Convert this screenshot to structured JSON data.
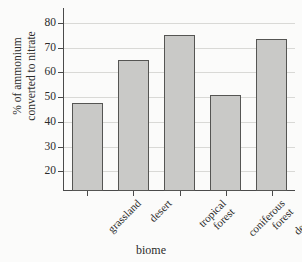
{
  "chart_data": {
    "type": "bar",
    "title": "",
    "xlabel": "biome",
    "ylabel": "% of ammonium converted to nitrate",
    "ylabel_lines": [
      "% of ammonium",
      "converted to nitrate"
    ],
    "categories": [
      "grassland",
      "desert",
      "tropical forest",
      "coniferous forest",
      "deciduous forest"
    ],
    "category_lines": [
      [
        "grassland"
      ],
      [
        "desert"
      ],
      [
        "tropical",
        "forest"
      ],
      [
        "coniferous",
        "forest"
      ],
      [
        "deciduous",
        "forest"
      ]
    ],
    "values": [
      47.5,
      65,
      75,
      51,
      73.5
    ],
    "ytick_labels": [
      "20",
      "30",
      "40",
      "50",
      "60",
      "70",
      "80"
    ],
    "ytick_values": [
      20,
      30,
      40,
      50,
      60,
      70,
      80
    ],
    "ylim": [
      12,
      86
    ],
    "grid": true,
    "grid_axis": "y",
    "legend": "none",
    "bar_fill": "#c9c9c7",
    "bar_stroke": "#555553",
    "grid_color": "#d9d9d6",
    "axis_color": "#4a4a4a",
    "background": "#fbfbfa"
  }
}
